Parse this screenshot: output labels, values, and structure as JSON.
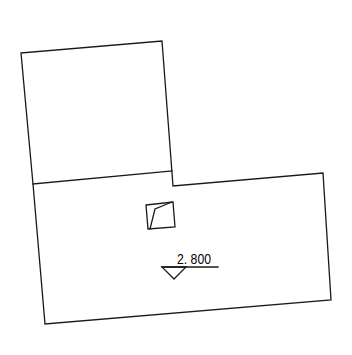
{
  "drawing": {
    "type": "floor plan outline",
    "stroke_color": "#1a1a1a",
    "background": "#ffffff",
    "elevation_marker": {
      "label": "2. 800",
      "symbol": "downward triangle"
    },
    "elements": [
      "upper room outline",
      "lower room outline",
      "column/opening symbol",
      "elevation mark"
    ]
  }
}
